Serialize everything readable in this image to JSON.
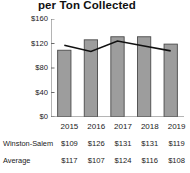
{
  "chart_data": {
    "type": "bar",
    "title": "per Ton Collected",
    "xlabel": "",
    "ylabel": "",
    "categories": [
      "2015",
      "2016",
      "2017",
      "2018",
      "2019"
    ],
    "ylim": [
      0,
      160
    ],
    "yticks": [
      "$0",
      "$40",
      "$80",
      "$120",
      "$160"
    ],
    "ytick_values": [
      0,
      40,
      80,
      120,
      160
    ],
    "grid": false,
    "legend": "none",
    "series": [
      {
        "name": "Winston-Salem",
        "render": "bar",
        "color": "#9d9d9d",
        "edge_color": "#4a4a4a",
        "values": [
          109,
          126,
          131,
          131,
          119
        ],
        "labels": [
          "$109",
          "$126",
          "$131",
          "$131",
          "$119"
        ]
      },
      {
        "name": "Average",
        "render": "line",
        "color": "#111111",
        "values": [
          117,
          107,
          124,
          116,
          108
        ],
        "labels": [
          "$117",
          "$107",
          "$124",
          "$116",
          "$108"
        ]
      }
    ]
  },
  "table": {
    "year_row": [
      "2015",
      "2016",
      "2017",
      "2018",
      "2019"
    ],
    "rows": [
      {
        "label": "Winston-Salem",
        "values": [
          "$109",
          "$126",
          "$131",
          "$131",
          "$119"
        ]
      },
      {
        "label": "Average",
        "values": [
          "$117",
          "$107",
          "$124",
          "$116",
          "$108"
        ]
      }
    ]
  }
}
